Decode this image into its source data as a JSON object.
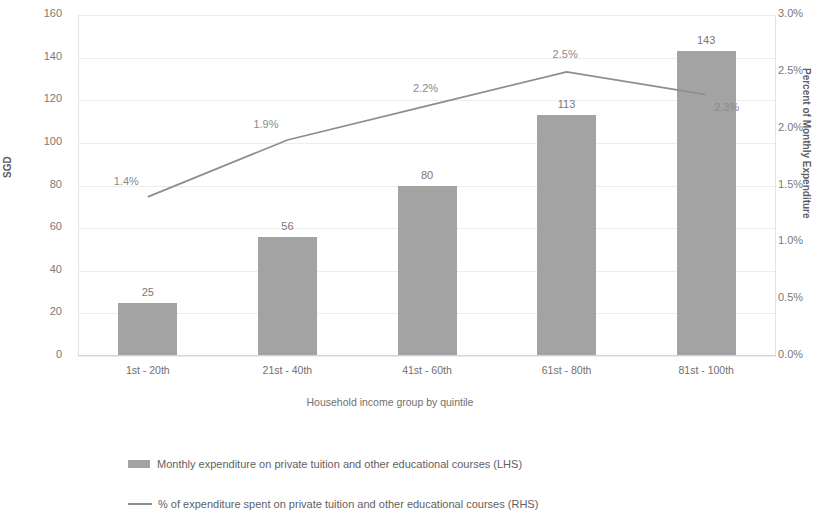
{
  "chart_data": {
    "type": "bar",
    "title": "",
    "categories": [
      "1st - 20th",
      "21st - 40th",
      "41st - 60th",
      "61st - 80th",
      "81st - 100th"
    ],
    "xlabel": "Household income group by quintile",
    "ylabel": "SGD",
    "y2label": "Percent of Monthly Expenditure",
    "ylim": [
      0,
      160
    ],
    "y2lim": [
      0,
      3.0
    ],
    "yticks": [
      "0",
      "20",
      "40",
      "60",
      "80",
      "100",
      "120",
      "140",
      "160"
    ],
    "ytick_values": [
      0,
      20,
      40,
      60,
      80,
      100,
      120,
      140,
      160
    ],
    "y2ticks": [
      "0.0%",
      "0.5%",
      "1.0%",
      "1.5%",
      "2.0%",
      "2.5%",
      "3.0%"
    ],
    "y2tick_values": [
      0.0,
      0.5,
      1.0,
      1.5,
      2.0,
      2.5,
      3.0
    ],
    "grid": false,
    "legend_position": "bottom",
    "series": [
      {
        "name": "Monthly expenditure on private tuition and other educational courses (LHS)",
        "type": "bar",
        "axis": "left",
        "color": "#a3a3a3",
        "values": [
          25,
          56,
          80,
          113,
          143
        ],
        "labels": [
          "25",
          "56",
          "80",
          "113",
          "143"
        ]
      },
      {
        "name": "% of expenditure spent on private tuition and other educational courses (RHS)",
        "type": "line",
        "axis": "right",
        "color": "#8e8e8e",
        "values": [
          1.4,
          1.9,
          2.2,
          2.5,
          2.3
        ],
        "labels": [
          "1.4%",
          "1.9%",
          "2.2%",
          "2.5%",
          "2.3%"
        ]
      }
    ]
  },
  "legend": {
    "bar_entry": "Monthly expenditure on private tuition and other educational courses (LHS)",
    "line_entry": "% of expenditure spent on private tuition and other educational courses (RHS)"
  }
}
